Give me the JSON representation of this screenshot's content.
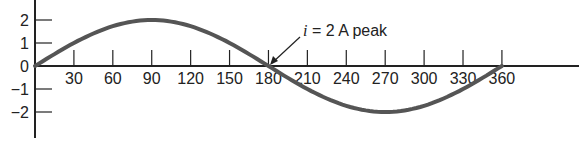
{
  "chart_data": {
    "type": "line",
    "title": "",
    "xlabel": "",
    "ylabel": "",
    "x_ticks": [
      30,
      60,
      90,
      120,
      150,
      180,
      210,
      240,
      270,
      300,
      330,
      360
    ],
    "y_ticks": [
      2,
      1,
      0,
      -1,
      -2
    ],
    "y_tick_labels": [
      "2",
      "1",
      "0",
      "−1",
      "−2"
    ],
    "xlim": [
      0,
      420
    ],
    "ylim": [
      -2.5,
      2.5
    ],
    "grid": false,
    "series": [
      {
        "name": "i",
        "function": "2*sin(theta)",
        "x": [
          0,
          30,
          60,
          90,
          120,
          150,
          180,
          210,
          240,
          270,
          300,
          330,
          360
        ],
        "values": [
          0,
          1,
          1.73,
          2,
          1.73,
          1,
          0,
          -1,
          -1.73,
          -2,
          -1.73,
          -1,
          0
        ],
        "color": "#555555"
      }
    ],
    "annotation": {
      "text_prefix": "i",
      "text_rest": " = 2 A peak",
      "points_to_x": 180,
      "points_to_y": 0
    }
  }
}
